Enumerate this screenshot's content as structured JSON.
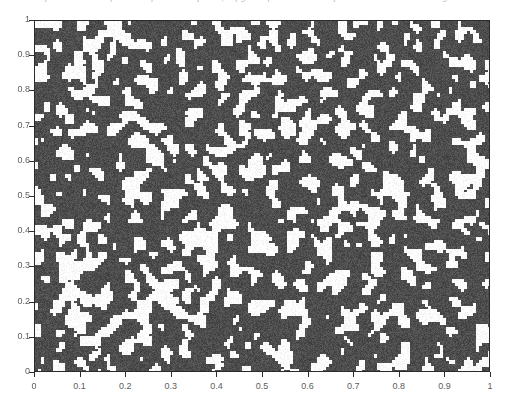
{
  "caption": {
    "text": "where p is the volume fraction of the black phase; a figure of a random two-phase microstructure at high resolution"
  },
  "figure": {
    "title": "",
    "background_color": "#ffffff"
  },
  "chart_data": {
    "type": "heatmap",
    "title": "",
    "subtitle": "",
    "xlabel": "",
    "ylabel": "",
    "xlim": [
      0,
      1
    ],
    "ylim": [
      0,
      1
    ],
    "grid": false,
    "legend": null,
    "phases": [
      {
        "name": "dark-phase",
        "color": "#4d4d4d",
        "area_fraction": 0.72
      },
      {
        "name": "light-phase",
        "color": "#ffffff",
        "area_fraction": 0.28
      }
    ],
    "x_ticks": [
      0,
      0.1,
      0.2,
      0.3,
      0.4,
      0.5,
      0.6,
      0.7,
      0.8,
      0.9,
      1
    ],
    "x_tick_labels": [
      "0",
      "0.1",
      "0.2",
      "0.3",
      "0.4",
      "0.5",
      "0.6",
      "0.7",
      "0.8",
      "0.9",
      "1"
    ],
    "y_ticks": [
      0,
      0.1,
      0.2,
      0.3,
      0.4,
      0.5,
      0.6,
      0.7,
      0.8,
      0.9,
      1
    ],
    "y_tick_labels": [
      "0",
      "0.1",
      "0.2",
      "0.3",
      "0.4",
      "0.5",
      "0.6",
      "0.7",
      "0.8",
      "0.9",
      "1"
    ],
    "texture": {
      "seed": 20240517,
      "grid_cells_x": 152,
      "grid_cells_y": 117,
      "threshold": 0.28,
      "smoothing_passes": 2,
      "cell_size_px": 3
    },
    "colors": {
      "axis": "#2b2b2b",
      "tick_label": "#5d5d5d",
      "plot_dark": "#4d4d4d",
      "plot_light": "#ffffff",
      "page_background": "#ffffff"
    }
  }
}
